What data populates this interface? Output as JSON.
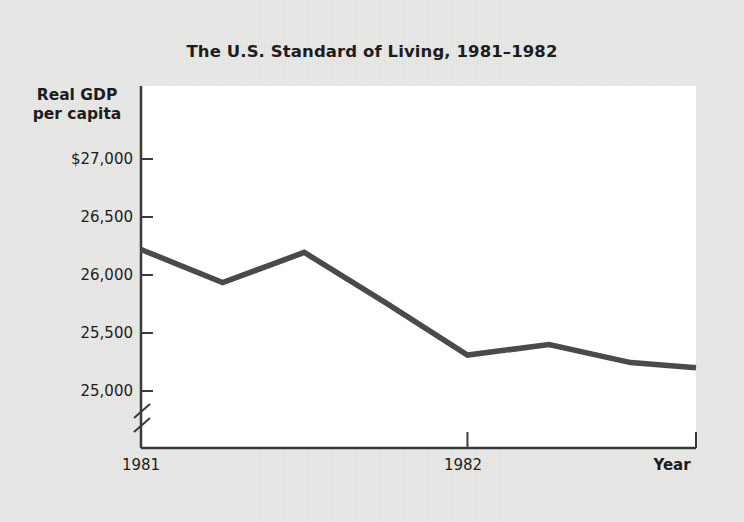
{
  "chart_data": {
    "type": "line",
    "title": "The U.S. Standard of Living, 1981–1982",
    "ylabel": "Real GDP\nper capita",
    "ylabel_line1": "Real GDP",
    "ylabel_line2": "per capita",
    "xlabel": "Year",
    "grid": false,
    "legend": null,
    "axis_break": true,
    "axis_break_note": "y-axis broken below 25,000",
    "ylim": [
      24800,
      27300
    ],
    "ytick_labels": [
      "$27,000",
      "26,500",
      "26,000",
      "25,500",
      "25,000"
    ],
    "ytick_values": [
      27000,
      26500,
      26000,
      25500,
      25000
    ],
    "xtick_labels": [
      "1981",
      "1982"
    ],
    "xtick_values": [
      1981.0,
      1982.0
    ],
    "xlim": [
      1981.0,
      1982.7
    ],
    "series": [
      {
        "name": "Real GDP per capita",
        "color": "#4a4a4a",
        "x": [
          1981.0,
          1981.25,
          1981.5,
          1981.75,
          1982.0,
          1982.25,
          1982.5,
          1982.7
        ],
        "values": [
          26220,
          25935,
          26195,
          25760,
          25310,
          25400,
          25245,
          25200
        ]
      }
    ]
  },
  "figure": {
    "background_color": "#e9e9e7",
    "plot_background_color": "#ffffff",
    "axis_color": "#3a3a3a",
    "line_color": "#4a4a4a",
    "text_color": "#1d1d1d"
  }
}
